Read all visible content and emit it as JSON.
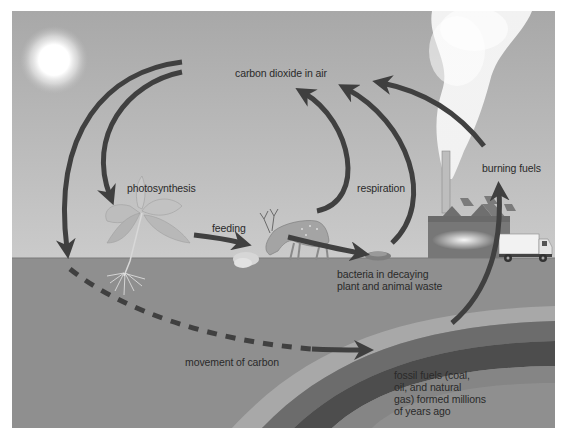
{
  "diagram": {
    "colors": {
      "sky_top": "#a9a9a9",
      "sky_bottom": "#c9c9c9",
      "ground": "#8e8e8e",
      "arrow": "#3f3f3f",
      "fossil_band_light": "#a6a6a6",
      "fossil_band_mid": "#6e6e6e",
      "fossil_band_dark": "#4a4a4a",
      "smoke": "#f2f2f2",
      "sun": "#ffffff",
      "text": "#2a2a2a"
    },
    "labels": {
      "carbon_dioxide": "carbon dioxide in air",
      "photosynthesis": "photosynthesis",
      "feeding": "feeding",
      "respiration": "respiration",
      "burning_fuels": "burning fuels",
      "bacteria_line1": "bacteria in decaying",
      "bacteria_line2": "plant and animal waste",
      "movement": "movement of carbon",
      "fossil_line1": "fossil fuels (coal,",
      "fossil_line2": "oil, and natural",
      "fossil_line3": "gas) formed millions",
      "fossil_line4": "of years ago"
    },
    "elements": [
      {
        "id": "sun",
        "kind": "illustration"
      },
      {
        "id": "plant",
        "kind": "illustration"
      },
      {
        "id": "deer",
        "kind": "illustration"
      },
      {
        "id": "decaying-waste",
        "kind": "illustration"
      },
      {
        "id": "factory",
        "kind": "illustration"
      },
      {
        "id": "smokestack-smoke",
        "kind": "illustration"
      },
      {
        "id": "truck",
        "kind": "illustration"
      },
      {
        "id": "fossil-fuel-layers",
        "kind": "illustration"
      }
    ],
    "arrows": [
      {
        "from": "carbon dioxide in air",
        "to": "plant",
        "label": "photosynthesis"
      },
      {
        "from": "carbon dioxide in air",
        "to": "ground",
        "label": "movement of carbon"
      },
      {
        "from": "plant",
        "to": "deer",
        "label": "feeding"
      },
      {
        "from": "deer",
        "to": "carbon dioxide in air",
        "label": "respiration"
      },
      {
        "from": "deer",
        "to": "decaying waste",
        "label": ""
      },
      {
        "from": "decaying waste",
        "to": "carbon dioxide in air",
        "label": "respiration"
      },
      {
        "from": "factory smoke",
        "to": "carbon dioxide in air",
        "label": "burning fuels"
      },
      {
        "from": "fossil fuels",
        "to": "factory",
        "label": "burning fuels"
      },
      {
        "from": "plant roots",
        "to": "fossil fuels",
        "label": "movement of carbon",
        "style": "dashed"
      }
    ]
  }
}
